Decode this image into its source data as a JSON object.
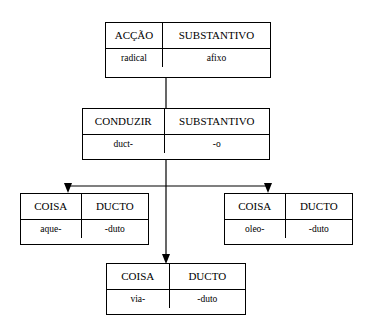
{
  "diagram": {
    "type": "tree",
    "nodes": [
      {
        "id": "root",
        "top_left": "ACÇÃO",
        "top_right": "SUBSTANTIVO",
        "bottom_left": "radical",
        "bottom_right": "afixo"
      },
      {
        "id": "level2",
        "top_left": "CONDUZIR",
        "top_right": "SUBSTANTIVO",
        "bottom_left": "duct-",
        "bottom_right": "-o"
      },
      {
        "id": "leaf-left",
        "top_left": "COISA",
        "top_right": "DUCTO",
        "bottom_left": "aque-",
        "bottom_right": "-duto"
      },
      {
        "id": "leaf-right",
        "top_left": "COISA",
        "top_right": "DUCTO",
        "bottom_left": "oleo-",
        "bottom_right": "-duto"
      },
      {
        "id": "leaf-bottom",
        "top_left": "COISA",
        "top_right": "DUCTO",
        "bottom_left": "via-",
        "bottom_right": "-duto"
      }
    ],
    "colors": {
      "line": "#000000",
      "box_border": "#000000",
      "background": "#ffffff",
      "text": "#000000"
    }
  }
}
